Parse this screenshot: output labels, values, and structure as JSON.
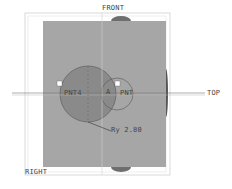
{
  "planes": {
    "front": "FRONT",
    "top": "TOP",
    "right": "RIGHT"
  },
  "points": {
    "left": "PNT4",
    "right": "PNT"
  },
  "axis_label": "A",
  "dimension": "Ry 2.80",
  "colors": {
    "background": "#ffffff",
    "body": "#a6a6a6",
    "large_circle": "#8a8a8a",
    "edge": "#555555"
  }
}
